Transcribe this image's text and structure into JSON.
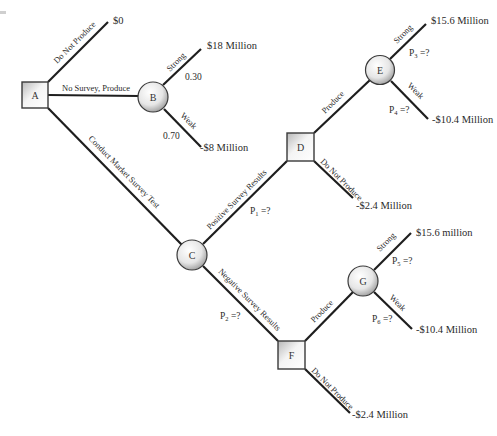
{
  "diagram": {
    "type": "decision-tree",
    "nodes": [
      {
        "id": "A",
        "shape": "decision-square",
        "label": "A"
      },
      {
        "id": "B",
        "shape": "chance-circle",
        "label": "B"
      },
      {
        "id": "C",
        "shape": "chance-circle",
        "label": "C"
      },
      {
        "id": "D",
        "shape": "decision-square",
        "label": "D"
      },
      {
        "id": "E",
        "shape": "chance-circle",
        "label": "E"
      },
      {
        "id": "F",
        "shape": "decision-square",
        "label": "F"
      },
      {
        "id": "G",
        "shape": "chance-circle",
        "label": "G"
      }
    ],
    "branches": {
      "a_do_not_produce": "Do Not Produce",
      "a_no_survey_produce": "No Survey, Produce",
      "a_conduct_survey": "Conduct Market Survey Test",
      "b_strong": "Strong",
      "b_weak": "Weak",
      "c_positive": "Positive Survey Results",
      "c_negative": "Negative Survey Results",
      "d_produce": "Produce",
      "d_do_not_produce": "Do Not Produce",
      "e_strong": "Strong",
      "e_weak": "Weak",
      "f_produce": "Produce",
      "f_do_not_produce": "Do Not Produce",
      "g_strong": "Strong",
      "g_weak": "Weak"
    },
    "probabilities": {
      "b_strong": "0.30",
      "b_weak": "0.70",
      "p1": {
        "base": "P",
        "sub": "1",
        "rest": " =?"
      },
      "p2": {
        "base": "P",
        "sub": "2",
        "rest": " =?"
      },
      "p3": {
        "base": "P",
        "sub": "3",
        "rest": " =?"
      },
      "p4": {
        "base": "P",
        "sub": "4",
        "rest": " =?"
      },
      "p5": {
        "base": "P",
        "sub": "5",
        "rest": " =?"
      },
      "p6": {
        "base": "P",
        "sub": "6",
        "rest": " =?"
      }
    },
    "payoffs": {
      "a_do_not_produce": "$0",
      "b_strong": "$18 Million",
      "b_weak": "-$8 Million",
      "e_strong": "$15.6 Million",
      "e_weak": "-$10.4 Million",
      "d_do_not_produce": "-$2.4 Million",
      "g_strong": "$15.6 million",
      "g_weak": "-$10.4 Million",
      "f_do_not_produce": "-$2.4 Million"
    }
  }
}
